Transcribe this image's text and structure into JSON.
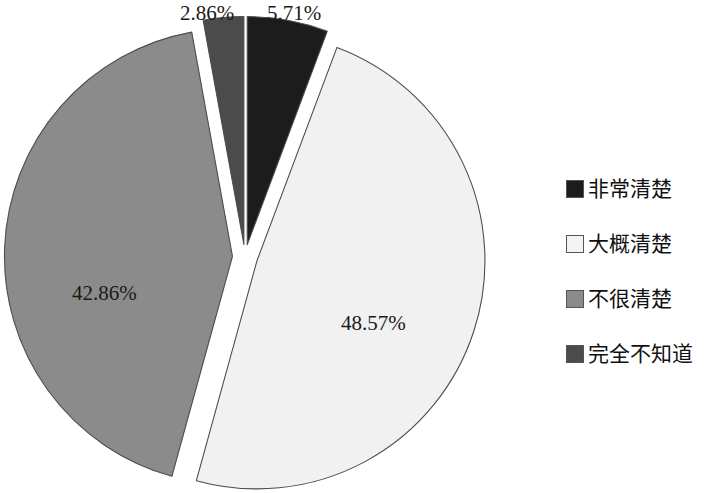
{
  "chart_data": {
    "type": "pie",
    "title": "",
    "subtitle": "",
    "xlabel": "",
    "ylabel": "",
    "grid": false,
    "legend_position": "right",
    "exploded": true,
    "start_angle_deg": 0,
    "direction": "clockwise",
    "categories": [
      "非常清楚",
      "大概清楚",
      "不很清楚",
      "完全不知道"
    ],
    "values": [
      5.71,
      48.57,
      42.86,
      2.86
    ],
    "value_unit": "%",
    "data_labels": [
      "5.71%",
      "48.57%",
      "42.86%",
      "2.86%"
    ],
    "colors": [
      "#1c1c1c",
      "#f1f1f1",
      "#8b8b8b",
      "#4b4b4b"
    ],
    "slices": [
      {
        "label": "非常清楚",
        "value": 5.71,
        "data_label": "5.71%",
        "color": "#1c1c1c",
        "start_deg": 0,
        "end_deg": 20.556,
        "explode": 0.055
      },
      {
        "label": "大概清楚",
        "value": 48.57,
        "data_label": "48.57%",
        "color": "#f1f1f1",
        "start_deg": 20.556,
        "end_deg": 195.408,
        "explode": 0.055
      },
      {
        "label": "不很清楚",
        "value": 42.86,
        "data_label": "42.86%",
        "color": "#8b8b8b",
        "start_deg": 195.408,
        "end_deg": 349.704,
        "explode": 0.055
      },
      {
        "label": "完全不知道",
        "value": 2.86,
        "data_label": "2.86%",
        "color": "#4b4b4b",
        "start_deg": 349.704,
        "end_deg": 360,
        "explode": 0.055
      }
    ]
  },
  "labels": {
    "slice_286": "2.86%",
    "slice_571": "5.71%",
    "slice_4286": "42.86%",
    "slice_4857": "48.57%"
  },
  "legend": {
    "items": [
      {
        "label": "非常清楚",
        "color": "#1c1c1c"
      },
      {
        "label": "大概清楚",
        "color": "#f4f4f4"
      },
      {
        "label": "不很清楚",
        "color": "#8b8b8b"
      },
      {
        "label": "完全不知道",
        "color": "#4b4b4b"
      }
    ]
  }
}
